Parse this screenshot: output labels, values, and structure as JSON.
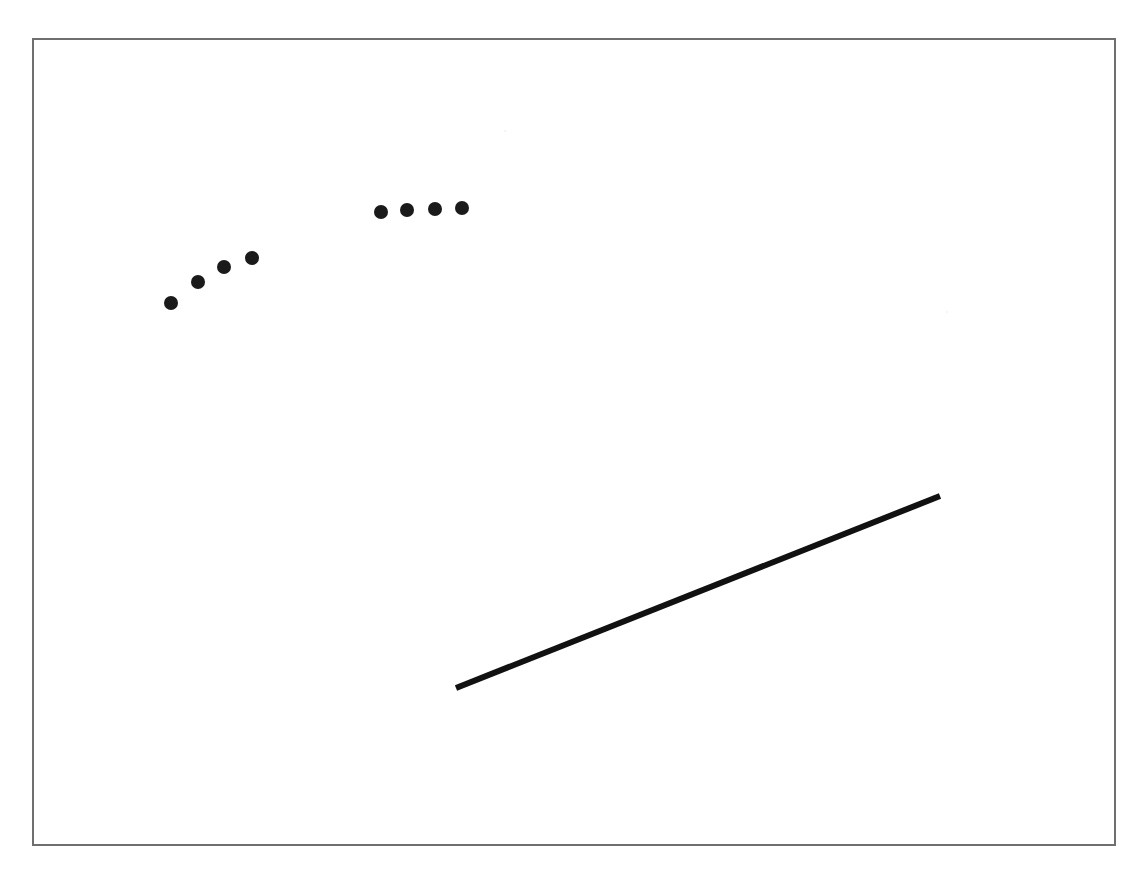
{
  "figure": {
    "title": "",
    "background_color": "#ffffff",
    "width": 1146,
    "height": 882
  },
  "frame": {
    "name": "plot-frame",
    "x": 32,
    "y": 38,
    "width": 1084,
    "height": 808,
    "stroke_color": "#6f6f6f",
    "stroke_width": 2
  },
  "chart_data": {
    "type": "scatter",
    "title": "",
    "subtitle": "",
    "xlabel": "",
    "ylabel": "",
    "grid": false,
    "legend": "none",
    "axis_visible": false,
    "xlim": [
      32,
      1116
    ],
    "ylim": [
      38,
      846
    ],
    "note": "Pixel-space figure: 8 filled black circular markers in two clusters plus one thick straight line segment, drawn inside a thin rectangular frame.",
    "marker": {
      "shape": "circle",
      "color": "#1a1a1a",
      "radius": 7,
      "diameter": 14
    },
    "series": [
      {
        "name": "cluster-left",
        "marker_color": "#1a1a1a",
        "points": [
          {
            "x": 171,
            "y": 303
          },
          {
            "x": 198,
            "y": 282
          },
          {
            "x": 224,
            "y": 267
          },
          {
            "x": 252,
            "y": 258
          }
        ]
      },
      {
        "name": "cluster-right",
        "marker_color": "#1a1a1a",
        "points": [
          {
            "x": 381,
            "y": 212
          },
          {
            "x": 407,
            "y": 210
          },
          {
            "x": 435,
            "y": 209
          },
          {
            "x": 462,
            "y": 208
          }
        ]
      }
    ],
    "lines": [
      {
        "name": "trend-line",
        "x1": 456,
        "y1": 688,
        "x2": 940,
        "y2": 496,
        "color": "#111111",
        "width": 6
      }
    ],
    "artifacts": [
      {
        "name": "scan-speck-upper",
        "x": 505,
        "y": 131,
        "radius": 1,
        "color": "#f2f2f4"
      },
      {
        "name": "scan-speck-right",
        "x": 947,
        "y": 312,
        "radius": 1,
        "color": "#f4f4f6"
      }
    ]
  }
}
